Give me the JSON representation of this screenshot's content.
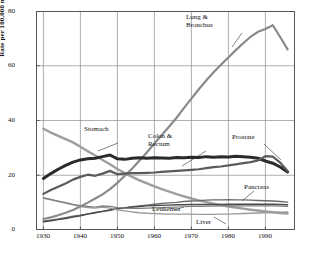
{
  "chart_data": {
    "type": "line",
    "title": "",
    "subtitle": "",
    "xlabel": "",
    "ylabel": "Rate per 100,000 male population",
    "xlim": [
      1928,
      1998
    ],
    "ylim": [
      0,
      80
    ],
    "xticks": [
      1930,
      1940,
      1950,
      1960,
      1970,
      1980,
      1990
    ],
    "yticks": [
      0,
      20,
      40,
      60,
      80
    ],
    "grid": "both",
    "legend_position": "inline-annotations",
    "x": [
      1930,
      1932,
      1934,
      1936,
      1938,
      1940,
      1942,
      1944,
      1946,
      1948,
      1950,
      1952,
      1954,
      1956,
      1958,
      1960,
      1962,
      1964,
      1966,
      1968,
      1970,
      1972,
      1974,
      1976,
      1978,
      1980,
      1982,
      1984,
      1986,
      1988,
      1990,
      1992,
      1994,
      1996
    ],
    "series": [
      {
        "name": "Lung & Bronchus",
        "color": "#8a8a8a",
        "width": 2.2,
        "values": [
          4.0,
          4.6,
          5.4,
          6.3,
          7.3,
          8.6,
          10.0,
          11.5,
          13.0,
          14.9,
          17.2,
          19.8,
          22.5,
          25.4,
          28.4,
          31.6,
          34.7,
          37.8,
          41.0,
          44.6,
          48.0,
          51.4,
          54.6,
          57.6,
          60.4,
          63.0,
          65.7,
          68.2,
          70.6,
          72.4,
          73.4,
          74.8,
          70.5,
          66.0
        ]
      },
      {
        "name": "Stomach",
        "color": "#9e9e9e",
        "width": 2.4,
        "values": [
          37.0,
          35.6,
          34.4,
          33.2,
          32.0,
          30.4,
          28.8,
          27.2,
          25.6,
          24.0,
          22.3,
          20.8,
          19.4,
          18.1,
          17.0,
          15.9,
          14.9,
          14.0,
          13.1,
          12.3,
          11.5,
          10.8,
          10.2,
          9.6,
          9.1,
          8.6,
          8.2,
          7.8,
          7.4,
          7.1,
          6.8,
          6.5,
          6.2,
          6.0
        ]
      },
      {
        "name": "Colon & Rectum",
        "color": "#2b2b2b",
        "width": 3.0,
        "values": [
          18.8,
          20.6,
          22.2,
          23.6,
          24.8,
          25.6,
          26.0,
          26.2,
          26.8,
          27.4,
          26.0,
          25.8,
          26.2,
          26.4,
          26.2,
          26.4,
          26.3,
          26.2,
          26.5,
          26.4,
          26.6,
          26.5,
          26.8,
          26.6,
          26.8,
          26.7,
          26.9,
          26.8,
          26.6,
          26.2,
          25.2,
          24.4,
          23.0,
          21.2
        ]
      },
      {
        "name": "Prostate",
        "color": "#5a5a5a",
        "width": 2.2,
        "values": [
          13.2,
          14.6,
          15.8,
          17.0,
          18.4,
          19.4,
          20.2,
          19.8,
          20.6,
          21.6,
          20.4,
          20.6,
          20.8,
          20.8,
          20.9,
          21.0,
          21.2,
          21.4,
          21.6,
          21.8,
          22.0,
          22.2,
          22.6,
          23.0,
          23.2,
          23.6,
          24.0,
          24.4,
          24.8,
          25.4,
          27.0,
          26.8,
          24.6,
          21.6
        ]
      },
      {
        "name": "Pancreas",
        "color": "#6b6b6b",
        "width": 1.4,
        "values": [
          3.2,
          3.6,
          4.0,
          4.5,
          5.0,
          5.4,
          5.9,
          6.4,
          6.8,
          7.2,
          7.7,
          8.1,
          8.5,
          8.8,
          9.1,
          9.4,
          9.7,
          9.9,
          10.1,
          10.4,
          10.6,
          10.7,
          10.9,
          11.0,
          11.0,
          11.1,
          11.0,
          11.0,
          10.9,
          10.8,
          10.7,
          10.6,
          10.4,
          10.2
        ]
      },
      {
        "name": "Leukemia",
        "color": "#4a4a4a",
        "width": 1.4,
        "values": [
          3.0,
          3.4,
          3.8,
          4.2,
          4.7,
          5.2,
          5.8,
          6.3,
          6.8,
          7.3,
          7.8,
          8.1,
          8.4,
          8.6,
          8.8,
          8.9,
          9.0,
          9.1,
          9.2,
          9.2,
          9.3,
          9.3,
          9.3,
          9.3,
          9.3,
          9.4,
          9.4,
          9.4,
          9.4,
          9.4,
          9.4,
          9.4,
          9.3,
          9.2
        ]
      },
      {
        "name": "Liver",
        "color": "#9a9a9a",
        "width": 1.4,
        "values": [
          11.6,
          11.0,
          10.4,
          9.8,
          9.2,
          8.6,
          8.2,
          8.0,
          8.4,
          8.0,
          7.4,
          7.0,
          6.6,
          6.3,
          6.1,
          6.0,
          5.9,
          5.8,
          5.8,
          5.8,
          5.8,
          5.7,
          5.7,
          5.7,
          5.8,
          5.8,
          5.9,
          6.0,
          6.1,
          6.2,
          6.3,
          6.4,
          6.5,
          6.6
        ]
      },
      {
        "name": "Unlabeled Lower Series",
        "color": "#7d7d7d",
        "width": 1.2,
        "values": [
          11.8,
          11.2,
          10.6,
          10.0,
          9.4,
          8.9,
          8.6,
          8.4,
          8.8,
          8.6,
          8.2,
          8.0,
          7.9,
          7.9,
          8.0,
          8.1,
          8.2,
          8.3,
          8.4,
          8.5,
          8.6,
          8.6,
          8.7,
          8.7,
          8.8,
          8.8,
          8.8,
          8.8,
          8.8,
          8.8,
          8.8,
          8.8,
          8.7,
          8.6
        ]
      }
    ],
    "annotations": [
      {
        "label": "Lung & Bronchus",
        "lines": [
          "Lung &",
          "Bronchus"
        ]
      },
      {
        "label": "Stomach",
        "lines": [
          "Stomach"
        ]
      },
      {
        "label": "Colon & Rectum",
        "lines": [
          "Colon &",
          "Rectum"
        ]
      },
      {
        "label": "Prostate",
        "lines": [
          "Prostate"
        ]
      },
      {
        "label": "Pancreas",
        "lines": [
          "Pancreas"
        ]
      },
      {
        "label": "Leukemia",
        "lines": [
          "Leukemia"
        ]
      },
      {
        "label": "Liver",
        "lines": [
          "Liver"
        ]
      }
    ]
  },
  "axes": {
    "ytick_labels": [
      "80",
      "60",
      "40",
      "20",
      "0"
    ],
    "xtick_labels": [
      "1930",
      "1940",
      "1950",
      "1960",
      "1970",
      "1980",
      "1990"
    ],
    "ylabel": "Rate per 100,000 male population"
  },
  "labels": {
    "lung_l1": "Lung &",
    "lung_l2": "Bronchus",
    "stomach": "Stomach",
    "colon_l1": "Colon &",
    "colon_l2": "Rectum",
    "prostate": "Prostate",
    "pancreas": "Pancreas",
    "leukemia": "Leukemia",
    "liver": "Liver"
  },
  "colors": {
    "axis": "#555555",
    "grid": "#8d8d8d",
    "text": "#111111"
  }
}
